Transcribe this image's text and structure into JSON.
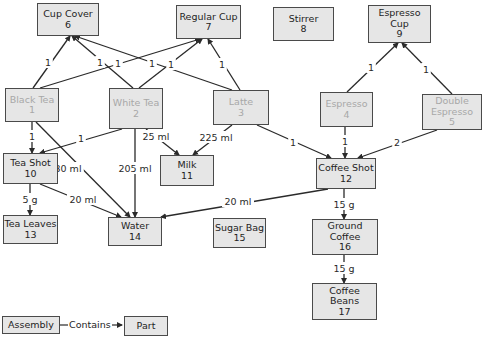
{
  "diagram": {
    "colors": {
      "node_fill": "#e6e6e6",
      "node_border": "#4a4a4a",
      "assembly_text": "#a8a8a8",
      "part_text": "#1e1e1e",
      "edge": "#2a2a2a"
    },
    "nodes": [
      {
        "id": "1",
        "label": "Black Tea",
        "type": "assembly",
        "x": 5,
        "y": 88,
        "w": 54,
        "h": 34
      },
      {
        "id": "2",
        "label": "White Tea",
        "type": "assembly",
        "x": 109,
        "y": 88,
        "w": 54,
        "h": 41
      },
      {
        "id": "3",
        "label": "Latte",
        "type": "assembly",
        "x": 213,
        "y": 90,
        "w": 56,
        "h": 35
      },
      {
        "id": "4",
        "label": "Espresso",
        "type": "assembly",
        "x": 320,
        "y": 92,
        "w": 53,
        "h": 35
      },
      {
        "id": "5",
        "label": "Double\nEspresso",
        "type": "assembly",
        "x": 422,
        "y": 94,
        "w": 60,
        "h": 36
      },
      {
        "id": "6",
        "label": "Cup Cover",
        "type": "part",
        "x": 37,
        "y": 3,
        "w": 62,
        "h": 33
      },
      {
        "id": "7",
        "label": "Regular Cup",
        "type": "part",
        "x": 176,
        "y": 5,
        "w": 65,
        "h": 34
      },
      {
        "id": "8",
        "label": "Stirrer",
        "type": "part",
        "x": 273,
        "y": 7,
        "w": 61,
        "h": 34
      },
      {
        "id": "9",
        "label": "Espresso\nCup",
        "type": "part",
        "x": 368,
        "y": 5,
        "w": 63,
        "h": 38
      },
      {
        "id": "10",
        "label": "Tea Shot",
        "type": "part",
        "x": 3,
        "y": 153,
        "w": 55,
        "h": 31
      },
      {
        "id": "11",
        "label": "Milk",
        "type": "part",
        "x": 160,
        "y": 155,
        "w": 54,
        "h": 31
      },
      {
        "id": "12",
        "label": "Coffee Shot",
        "type": "part",
        "x": 316,
        "y": 158,
        "w": 60,
        "h": 31
      },
      {
        "id": "13",
        "label": "Tea Leaves",
        "type": "part",
        "x": 3,
        "y": 215,
        "w": 55,
        "h": 29
      },
      {
        "id": "14",
        "label": "Water",
        "type": "part",
        "x": 108,
        "y": 217,
        "w": 54,
        "h": 29
      },
      {
        "id": "15",
        "label": "Sugar Bag",
        "type": "part",
        "x": 213,
        "y": 218,
        "w": 53,
        "h": 30
      },
      {
        "id": "16",
        "label": "Ground\nCoffee",
        "type": "part",
        "x": 312,
        "y": 219,
        "w": 66,
        "h": 36
      },
      {
        "id": "17",
        "label": "Coffee\nBeans",
        "type": "part",
        "x": 312,
        "y": 283,
        "w": 65,
        "h": 37
      }
    ],
    "edges": [
      {
        "from": "1",
        "to": "6",
        "label": "1",
        "path": [
          [
            33,
            88
          ],
          [
            70,
            36
          ]
        ],
        "lx": 48,
        "ly": 62
      },
      {
        "from": "1",
        "to": "7",
        "label": "1",
        "path": [
          [
            40,
            88
          ],
          [
            200,
            39
          ]
        ],
        "lx": 118,
        "ly": 63
      },
      {
        "from": "2",
        "to": "6",
        "label": "1",
        "path": [
          [
            133,
            88
          ],
          [
            72,
            36
          ]
        ],
        "lx": 100,
        "ly": 62
      },
      {
        "from": "2",
        "to": "7",
        "label": "1",
        "path": [
          [
            139,
            88
          ],
          [
            202,
            39
          ]
        ],
        "lx": 171,
        "ly": 64
      },
      {
        "from": "3",
        "to": "6",
        "label": "1",
        "path": [
          [
            232,
            90
          ],
          [
            75,
            36
          ]
        ],
        "lx": 152,
        "ly": 63
      },
      {
        "from": "3",
        "to": "7",
        "label": "1",
        "path": [
          [
            240,
            90
          ],
          [
            208,
            39
          ]
        ],
        "lx": 222,
        "ly": 64
      },
      {
        "from": "4",
        "to": "9",
        "label": "1",
        "path": [
          [
            347,
            92
          ],
          [
            398,
            43
          ]
        ],
        "lx": 371,
        "ly": 67
      },
      {
        "from": "5",
        "to": "9",
        "label": "1",
        "path": [
          [
            452,
            94
          ],
          [
            402,
            43
          ]
        ],
        "lx": 426,
        "ly": 69
      },
      {
        "from": "1",
        "to": "10",
        "label": "1",
        "path": [
          [
            32,
            122
          ],
          [
            32,
            153
          ]
        ],
        "lx": 32,
        "ly": 136
      },
      {
        "from": "1",
        "to": "14",
        "label": "230 ml",
        "path": [
          [
            36,
            122
          ],
          [
            130,
            217
          ]
        ],
        "lx": 65,
        "ly": 168
      },
      {
        "from": "2",
        "to": "10",
        "label": "1",
        "path": [
          [
            122,
            129
          ],
          [
            40,
            153
          ]
        ],
        "lx": 81,
        "ly": 138
      },
      {
        "from": "2",
        "to": "14",
        "label": "205 ml",
        "path": [
          [
            135,
            129
          ],
          [
            135,
            217
          ]
        ],
        "lx": 135,
        "ly": 168
      },
      {
        "from": "2",
        "to": "11",
        "label": "25 ml",
        "path": [
          [
            146,
            129
          ],
          [
            179,
            155
          ]
        ],
        "lx": 156,
        "ly": 136
      },
      {
        "from": "3",
        "to": "11",
        "label": "225 ml",
        "path": [
          [
            232,
            125
          ],
          [
            193,
            155
          ]
        ],
        "lx": 216,
        "ly": 137
      },
      {
        "from": "3",
        "to": "12",
        "label": "1",
        "path": [
          [
            257,
            125
          ],
          [
            331,
            158
          ]
        ],
        "lx": 293,
        "ly": 142
      },
      {
        "from": "4",
        "to": "12",
        "label": "1",
        "path": [
          [
            345,
            127
          ],
          [
            345,
            158
          ]
        ],
        "lx": 345,
        "ly": 141
      },
      {
        "from": "5",
        "to": "12",
        "label": "2",
        "path": [
          [
            437,
            130
          ],
          [
            358,
            158
          ]
        ],
        "lx": 397,
        "ly": 142
      },
      {
        "from": "10",
        "to": "13",
        "label": "5 g",
        "path": [
          [
            30,
            184
          ],
          [
            30,
            215
          ]
        ],
        "lx": 30,
        "ly": 199
      },
      {
        "from": "10",
        "to": "14",
        "label": "20 ml",
        "path": [
          [
            40,
            184
          ],
          [
            121,
            217
          ]
        ],
        "lx": 83,
        "ly": 199
      },
      {
        "from": "12",
        "to": "14",
        "label": "20 ml",
        "path": [
          [
            328,
            189
          ],
          [
            161,
            217
          ]
        ],
        "lx": 238,
        "ly": 201
      },
      {
        "from": "12",
        "to": "16",
        "label": "15 g",
        "path": [
          [
            344,
            189
          ],
          [
            344,
            219
          ]
        ],
        "lx": 344,
        "ly": 204
      },
      {
        "from": "16",
        "to": "17",
        "label": "15 g",
        "path": [
          [
            344,
            255
          ],
          [
            344,
            283
          ]
        ],
        "lx": 344,
        "ly": 268
      }
    ],
    "legend": {
      "assembly_label": "Assembly",
      "relation_label": "Contains",
      "part_label": "Part"
    }
  }
}
